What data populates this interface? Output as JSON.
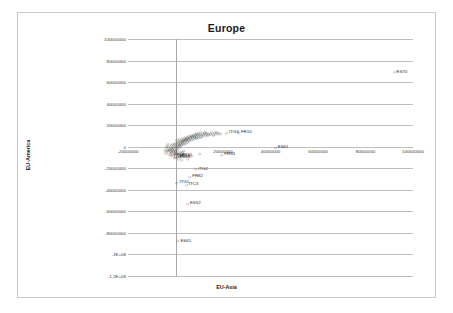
{
  "chart_data": {
    "type": "scatter",
    "title": "Europe",
    "xlabel": "EU-Asia",
    "ylabel": "EU-America",
    "xlim": [
      -20000000,
      100000000
    ],
    "ylim": [
      -120000000,
      100000000
    ],
    "grid": "horizontal",
    "legend": "none",
    "xticks": [
      -20000000,
      0,
      20000000,
      40000000,
      60000000,
      80000000,
      100000000
    ],
    "xticklabels": [
      "-20000000",
      "0",
      "20000000",
      "40000000",
      "60000000",
      "80000000",
      "100000000"
    ],
    "yticks": [
      100000000,
      80000000,
      60000000,
      40000000,
      20000000,
      0,
      -20000000,
      -40000000,
      -60000000,
      -80000000,
      -100000000,
      -120000000
    ],
    "yticklabels": [
      "100000000",
      "80000000",
      "60000000",
      "40000000",
      "20000000",
      "0",
      "-20000000",
      "-40000000",
      "-60000000",
      "-80000000",
      "-1E+08",
      "-1.2E+08"
    ],
    "marker": "diamond",
    "marker_color": "#404040",
    "labeled_points": [
      {
        "label": "ES70",
        "x": 92000000,
        "y": 70000000
      },
      {
        "label": "ITG4",
        "x": 21500000,
        "y": 14000000
      },
      {
        "label": "FR10",
        "x": 26500000,
        "y": 14000000
      },
      {
        "label": "FR83",
        "x": 19500000,
        "y": -6500000
      },
      {
        "label": "ES61",
        "x": 42000000,
        "y": 0
      },
      {
        "label": "ITG2",
        "x": 8500000,
        "y": -20000000
      },
      {
        "label": "FR82",
        "x": 6000000,
        "y": -27000000
      },
      {
        "label": "ITC3",
        "x": 4500000,
        "y": -34500000
      },
      {
        "label": "ITC4",
        "x": 900000,
        "y": -8500000
      },
      {
        "label": "ITG1",
        "x": 600000,
        "y": -32500000
      },
      {
        "label": "ES52",
        "x": 5000000,
        "y": -52000000
      },
      {
        "label": "ES61",
        "x": 1000000,
        "y": -87000000
      },
      {
        "label": "FR62",
        "x": -1800000,
        "y": -7000000
      },
      {
        "label": "ES51",
        "x": 1500000,
        "y": -7500000
      },
      {
        "label": "ES53",
        "x": 600000,
        "y": -9000000
      }
    ],
    "cluster_points": [
      {
        "x": -2400000,
        "y": -1800000
      },
      {
        "x": -2100000,
        "y": -900000
      },
      {
        "x": -1900000,
        "y": -2600000
      },
      {
        "x": -1700000,
        "y": 200000
      },
      {
        "x": -1500000,
        "y": -4200000
      },
      {
        "x": -1300000,
        "y": -1200000
      },
      {
        "x": -1100000,
        "y": 900000
      },
      {
        "x": -900000,
        "y": -3100000
      },
      {
        "x": -700000,
        "y": -500000
      },
      {
        "x": -500000,
        "y": 1600000
      },
      {
        "x": -300000,
        "y": -2200000
      },
      {
        "x": -100000,
        "y": 600000
      },
      {
        "x": 100000,
        "y": 2100000
      },
      {
        "x": 300000,
        "y": -1400000
      },
      {
        "x": 500000,
        "y": 1100000
      },
      {
        "x": 700000,
        "y": 2800000
      },
      {
        "x": 900000,
        "y": -600000
      },
      {
        "x": 1100000,
        "y": 1900000
      },
      {
        "x": 1300000,
        "y": 3300000
      },
      {
        "x": 1500000,
        "y": 400000
      },
      {
        "x": 1700000,
        "y": 2500000
      },
      {
        "x": 1900000,
        "y": 4100000
      },
      {
        "x": 2100000,
        "y": 1300000
      },
      {
        "x": 2300000,
        "y": 3600000
      },
      {
        "x": 2500000,
        "y": 5200000
      },
      {
        "x": 2700000,
        "y": 2200000
      },
      {
        "x": 2900000,
        "y": 4400000
      },
      {
        "x": 3100000,
        "y": 6100000
      },
      {
        "x": 3300000,
        "y": 3000000
      },
      {
        "x": 3500000,
        "y": 5400000
      },
      {
        "x": 3700000,
        "y": 7000000
      },
      {
        "x": 3900000,
        "y": 3900000
      },
      {
        "x": 4100000,
        "y": 6300000
      },
      {
        "x": 4300000,
        "y": 8100000
      },
      {
        "x": 4500000,
        "y": 4700000
      },
      {
        "x": 4700000,
        "y": 7200000
      },
      {
        "x": 4900000,
        "y": 9000000
      },
      {
        "x": 5100000,
        "y": 5500000
      },
      {
        "x": 5400000,
        "y": 8000000
      },
      {
        "x": 5700000,
        "y": 9800000
      },
      {
        "x": 6000000,
        "y": 6300000
      },
      {
        "x": 6300000,
        "y": 8800000
      },
      {
        "x": 6600000,
        "y": 10600000
      },
      {
        "x": 6900000,
        "y": 7100000
      },
      {
        "x": 7200000,
        "y": 9500000
      },
      {
        "x": 7500000,
        "y": 11300000
      },
      {
        "x": 7800000,
        "y": 7900000
      },
      {
        "x": 8100000,
        "y": 10200000
      },
      {
        "x": 8400000,
        "y": 12000000
      },
      {
        "x": 8700000,
        "y": 8600000
      },
      {
        "x": 9000000,
        "y": 10900000
      },
      {
        "x": 9400000,
        "y": 12600000
      },
      {
        "x": 9800000,
        "y": 9300000
      },
      {
        "x": 10200000,
        "y": 11500000
      },
      {
        "x": 10600000,
        "y": 13100000
      },
      {
        "x": 11000000,
        "y": 10000000
      },
      {
        "x": 11500000,
        "y": 12100000
      },
      {
        "x": 12000000,
        "y": 13600000
      },
      {
        "x": 12500000,
        "y": 10700000
      },
      {
        "x": 13000000,
        "y": 12700000
      },
      {
        "x": 13500000,
        "y": 14000000
      },
      {
        "x": 14000000,
        "y": 11400000
      },
      {
        "x": 14600000,
        "y": 13200000
      },
      {
        "x": 15200000,
        "y": 14300000
      },
      {
        "x": 15800000,
        "y": 12000000
      },
      {
        "x": 16400000,
        "y": 13700000
      },
      {
        "x": 17000000,
        "y": 14600000
      },
      {
        "x": 17600000,
        "y": 12600000
      },
      {
        "x": 18200000,
        "y": 14100000
      },
      {
        "x": 18800000,
        "y": 13000000
      },
      {
        "x": -2800000,
        "y": -5800000
      },
      {
        "x": -2200000,
        "y": -6600000
      },
      {
        "x": -1600000,
        "y": -5100000
      },
      {
        "x": -1000000,
        "y": -7400000
      },
      {
        "x": -400000,
        "y": -6000000
      },
      {
        "x": 200000,
        "y": -8200000
      },
      {
        "x": 800000,
        "y": -5400000
      },
      {
        "x": 1400000,
        "y": -7800000
      },
      {
        "x": 2000000,
        "y": -6400000
      },
      {
        "x": 2600000,
        "y": -9000000
      },
      {
        "x": 3200000,
        "y": -5900000
      },
      {
        "x": 3800000,
        "y": -7300000
      },
      {
        "x": -3200000,
        "y": -3400000
      },
      {
        "x": -2600000,
        "y": -2000000
      },
      {
        "x": -2000000,
        "y": -3900000
      },
      {
        "x": -1400000,
        "y": -2400000
      },
      {
        "x": -800000,
        "y": -4300000
      },
      {
        "x": -200000,
        "y": -3000000
      },
      {
        "x": 400000,
        "y": -4700000
      },
      {
        "x": 1000000,
        "y": -3500000
      },
      {
        "x": 1600000,
        "y": -5000000
      },
      {
        "x": 2200000,
        "y": -3800000
      },
      {
        "x": 2800000,
        "y": -4400000
      },
      {
        "x": 3400000,
        "y": -2900000
      },
      {
        "x": 600000,
        "y": 7400000
      },
      {
        "x": 1200000,
        "y": 6100000
      },
      {
        "x": 1800000,
        "y": 8300000
      },
      {
        "x": 2400000,
        "y": 7000000
      },
      {
        "x": 3000000,
        "y": 9200000
      },
      {
        "x": 3600000,
        "y": 8000000
      },
      {
        "x": 4200000,
        "y": 10100000
      },
      {
        "x": 4800000,
        "y": 8800000
      },
      {
        "x": 5400000,
        "y": 11000000
      },
      {
        "x": 6000000,
        "y": 9700000
      },
      {
        "x": 6600000,
        "y": 12200000
      },
      {
        "x": 7200000,
        "y": 11000000
      },
      {
        "x": 7800000,
        "y": 13000000
      },
      {
        "x": 8400000,
        "y": 11700000
      },
      {
        "x": 9000000,
        "y": 13700000
      },
      {
        "x": 9600000,
        "y": 12400000
      },
      {
        "x": 10400000,
        "y": 14200000
      },
      {
        "x": 11200000,
        "y": 13000000
      },
      {
        "x": 12000000,
        "y": 14700000
      },
      {
        "x": 12800000,
        "y": 13500000
      },
      {
        "x": -3600000,
        "y": 600000
      },
      {
        "x": -3000000,
        "y": -700000
      },
      {
        "x": -3400000,
        "y": -1900000
      },
      {
        "x": -3800000,
        "y": -3000000
      },
      {
        "x": -2400000,
        "y": 1400000
      },
      {
        "x": -1800000,
        "y": 2200000
      },
      {
        "x": -1200000,
        "y": 3000000
      },
      {
        "x": -600000,
        "y": 3900000
      },
      {
        "x": 0,
        "y": 4800000
      },
      {
        "x": 700000,
        "y": 5600000
      },
      {
        "x": 1400000,
        "y": 4400000
      },
      {
        "x": 2100000,
        "y": 6600000
      },
      {
        "x": 2800000,
        "y": 5900000
      },
      {
        "x": 3500000,
        "y": 7600000
      },
      {
        "x": 4200000,
        "y": 6900000
      },
      {
        "x": 4900000,
        "y": 8500000
      },
      {
        "x": 5600000,
        "y": 7600000
      },
      {
        "x": 6400000,
        "y": 9200000
      },
      {
        "x": 7100000,
        "y": 8400000
      },
      {
        "x": 8000000,
        "y": 10000000
      },
      {
        "x": 8800000,
        "y": 9200000
      },
      {
        "x": 9700000,
        "y": 10800000
      },
      {
        "x": 10600000,
        "y": 10000000
      },
      {
        "x": 11600000,
        "y": 11600000
      },
      {
        "x": 13600000,
        "y": 11800000
      },
      {
        "x": 14800000,
        "y": 12500000
      },
      {
        "x": 16000000,
        "y": 11900000
      },
      {
        "x": 17200000,
        "y": 13400000
      },
      {
        "x": -4200000,
        "y": -4600000
      },
      {
        "x": -4600000,
        "y": -2200000
      },
      {
        "x": -4000000,
        "y": 1800000
      },
      {
        "x": -3400000,
        "y": 3200000
      },
      {
        "x": 5000000,
        "y": -10500000
      },
      {
        "x": 6800000,
        "y": -8000000
      },
      {
        "x": 10000000,
        "y": -6000000
      },
      {
        "x": 1300000,
        "y": -10800000
      },
      {
        "x": 2400000,
        "y": -11500000
      },
      {
        "x": -500000,
        "y": -9800000
      }
    ]
  }
}
